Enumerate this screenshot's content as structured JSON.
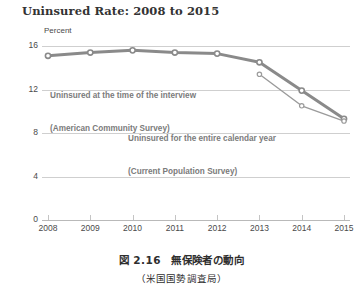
{
  "chart_data": {
    "type": "line",
    "title": "Uninsured Rate: 2008 to 2015",
    "xlabel": "",
    "ylabel": "Percent",
    "ylim": [
      0,
      16
    ],
    "yticks": [
      0,
      4,
      8,
      12,
      16
    ],
    "ytick_labels": [
      "0",
      "4",
      "8",
      "12",
      "16"
    ],
    "categories": [
      "2008",
      "2009",
      "2010",
      "2011",
      "2012",
      "2013",
      "2014",
      "2015"
    ],
    "x": [
      2008,
      2009,
      2010,
      2011,
      2012,
      2013,
      2014,
      2015
    ],
    "grid": true,
    "legend_position": "inline-annotation",
    "series": [
      {
        "name": "Uninsured at the time of the interview (American Community Survey)",
        "short_name": "American Community Survey",
        "values": [
          15.1,
          15.4,
          15.6,
          15.4,
          15.3,
          14.5,
          11.9,
          9.3
        ],
        "color": "#8a8a8a",
        "line_width": 3,
        "marker": "open-circle"
      },
      {
        "name": "Uninsured for the entire calendar year (Current Population Survey)",
        "short_name": "Current Population Survey",
        "values": [
          null,
          null,
          null,
          null,
          null,
          13.4,
          10.5,
          9.1
        ],
        "color": "#9b9b9b",
        "line_width": 1.4,
        "marker": "open-circle"
      }
    ],
    "annotations": [
      {
        "id": "acs",
        "line1": "Uninsured at the time of the interview",
        "line2": "(American Community Survey)"
      },
      {
        "id": "cps",
        "line1": "Uninsured for the entire calendar year",
        "line2": "(Current Population Survey)"
      }
    ]
  },
  "chart": {
    "title": "Uninsured Rate: 2008 to 2015",
    "axis_unit_label": "Percent"
  },
  "caption": {
    "main": "図 2.16　無保険者の動向",
    "source": "（米国国勢調査局）"
  },
  "colors": {
    "line_primary": "#8a8a8a",
    "line_secondary": "#9b9b9b",
    "gridline": "#cfcfcf",
    "text": "#3d3d3d",
    "annotation": "#7b7b7b",
    "background": "#ffffff"
  }
}
